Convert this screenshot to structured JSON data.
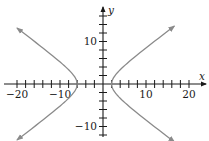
{
  "chart_data": {
    "type": "line",
    "title": "",
    "equation": "(x+2)^2/16 - y^2/9 = 1",
    "xlabel": "x",
    "ylabel": "y",
    "xlim": [
      -21,
      23
    ],
    "ylim": [
      -12,
      18
    ],
    "x_ticks_step": 2,
    "y_ticks_step": 2,
    "x_tick_labels": [
      {
        "value": -20,
        "label": "−20"
      },
      {
        "value": -10,
        "label": "−10"
      },
      {
        "value": 10,
        "label": "10"
      },
      {
        "value": 20,
        "label": "20"
      }
    ],
    "y_tick_labels": [
      {
        "value": 10,
        "label": "10"
      },
      {
        "value": -10,
        "label": "−10"
      }
    ],
    "grid": false,
    "series": [
      {
        "name": "left branch",
        "center": [
          -2,
          0
        ],
        "a": 4,
        "b": 3,
        "branch": "left",
        "x_range": [
          -20,
          -6
        ],
        "color": "#8a8a8a"
      },
      {
        "name": "right branch",
        "center": [
          -2,
          0
        ],
        "a": 4,
        "b": 3,
        "branch": "right",
        "x_range": [
          2,
          16.6
        ],
        "color": "#8a8a8a"
      }
    ],
    "vertices": [
      [
        -6,
        0
      ],
      [
        2,
        0
      ]
    ],
    "axis_color": "#1a1a1a",
    "curve_color": "#8a8a8a"
  }
}
